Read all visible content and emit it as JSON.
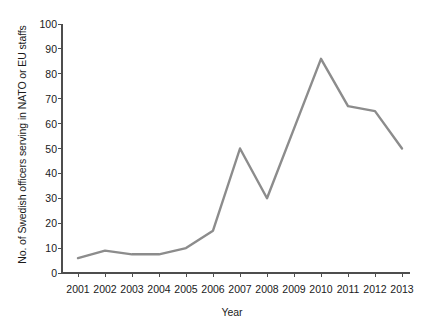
{
  "chart_data": {
    "type": "line",
    "title": "",
    "xlabel": "Year",
    "ylabel": "No. of Swedish officers serving in NATO or EU staffs",
    "categories": [
      "2001",
      "2002",
      "2003",
      "2004",
      "2005",
      "2006",
      "2007",
      "2008",
      "2009",
      "2010",
      "2011",
      "2012",
      "2013"
    ],
    "x": [
      2001,
      2002,
      2003,
      2004,
      2005,
      2006,
      2007,
      2008,
      2009,
      2010,
      2011,
      2012,
      2013
    ],
    "values": [
      6,
      9,
      7.5,
      7.5,
      10,
      17,
      50,
      30,
      58,
      86,
      67,
      65,
      50
    ],
    "series": [
      {
        "name": "No. of Swedish officers serving in NATO or EU staffs",
        "values": [
          6,
          9,
          7.5,
          7.5,
          10,
          17,
          50,
          30,
          58,
          86,
          67,
          65,
          50
        ]
      }
    ],
    "ylim": [
      0,
      100
    ],
    "xlim": [
      2001,
      2013
    ],
    "yticks": [
      0,
      10,
      20,
      30,
      40,
      50,
      60,
      70,
      80,
      90,
      100
    ],
    "ytick_labels": [
      "0",
      "10",
      "20",
      "30",
      "40",
      "50",
      "60",
      "70",
      "80",
      "90",
      "100"
    ],
    "grid": false,
    "legend": false,
    "legend_position": "none",
    "line_color": "#8c8c8c",
    "axis_color": "#4d4d4d",
    "background_color": "#ffffff"
  }
}
